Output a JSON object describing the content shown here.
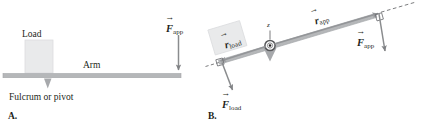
{
  "figure": {
    "panels": [
      {
        "letter": "A.",
        "name": "horizontal-lever",
        "labels": {
          "load": "Load",
          "arm": "Arm",
          "fulcrum": "Fulcrum or pivot"
        },
        "vectors": [
          {
            "name": "force-applied",
            "symbol": "F",
            "subscript": "app",
            "arrow_over": "→",
            "direction": "down"
          }
        ]
      },
      {
        "letter": "B.",
        "name": "tilted-lever",
        "labels": {
          "axis": "z"
        },
        "vectors": [
          {
            "name": "r-load",
            "symbol": "r",
            "subscript": "load",
            "arrow_over": "→",
            "direction": "down-left-along-lever"
          },
          {
            "name": "r-app",
            "symbol": "r",
            "subscript": "app",
            "arrow_over": "→",
            "direction": "up-right-along-lever"
          },
          {
            "name": "force-load",
            "symbol": "F",
            "subscript": "load",
            "arrow_over": "→",
            "direction": "down"
          },
          {
            "name": "force-applied",
            "symbol": "F",
            "subscript": "app",
            "arrow_over": "→",
            "direction": "down"
          }
        ]
      }
    ],
    "colors": {
      "text": "#231f20",
      "bar": "#a7a9ac",
      "bar_edge": "#939598",
      "fulcrum": "#a7a9ac",
      "load_block": "#e6e7e8",
      "load_block_edge": "#d1d3d4",
      "vector_arrow": "#808285",
      "dashed_line": "#6d6e71"
    }
  }
}
